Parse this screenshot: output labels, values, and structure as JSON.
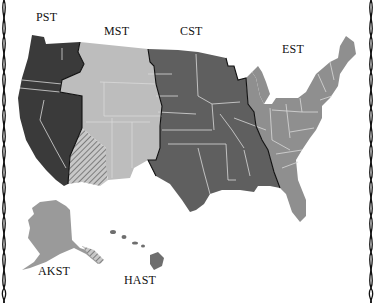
{
  "map": {
    "title": "U.S. Time Zones",
    "zones": [
      {
        "id": "pst",
        "label": "PST",
        "name": "Pacific",
        "color": "#3a3a3a"
      },
      {
        "id": "mst",
        "label": "MST",
        "name": "Mountain",
        "color": "#bdbdbd"
      },
      {
        "id": "cst",
        "label": "CST",
        "name": "Central",
        "color": "#5f5f5f"
      },
      {
        "id": "est",
        "label": "EST",
        "name": "Eastern",
        "color": "#8f8f8f"
      },
      {
        "id": "akst",
        "label": "AKST",
        "name": "Alaska",
        "color": "#9a9a9a"
      },
      {
        "id": "hast",
        "label": "HAST",
        "name": "Hawaii-Aleutian",
        "color": "#6e6e6e"
      }
    ],
    "hatched_region": "Arizona (no DST)",
    "state_line_color": "#d9d9d9",
    "zone_boundary_color": "#111111",
    "background": "#ffffff"
  }
}
